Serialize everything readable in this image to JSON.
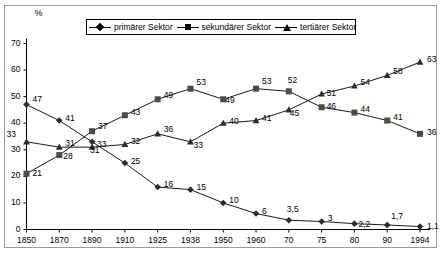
{
  "frame": {
    "border_color": "#9a9a9a"
  },
  "axis": {
    "y_unit": "%",
    "y_ticks": [
      "0",
      "10",
      "20",
      "30",
      "40",
      "50",
      "60",
      "70"
    ],
    "x_ticks": [
      "1850",
      "1870",
      "1890",
      "1910",
      "1925",
      "1938",
      "1950",
      "1960",
      "70",
      "75",
      "80",
      "90",
      "1994"
    ]
  },
  "legend": {
    "position": "top-center",
    "items": [
      {
        "label": "primärer Sektor",
        "marker": "diamond-marker",
        "color": "#000000"
      },
      {
        "label": "sekundärer Sektor",
        "marker": "square-marker",
        "color": "#000000"
      },
      {
        "label": "tertiärer Sektor",
        "marker": "triangle-marker",
        "color": "#000000"
      }
    ]
  },
  "chart_data": {
    "type": "line",
    "title": "",
    "xlabel": "",
    "ylabel": "%",
    "ylim": [
      0,
      70
    ],
    "ytick_step": 10,
    "grid": false,
    "legend_position": "top-center",
    "categories": [
      "1850",
      "1870",
      "1890",
      "1910",
      "1925",
      "1938",
      "1950",
      "1960",
      "70",
      "75",
      "80",
      "90",
      "1994"
    ],
    "series": [
      {
        "name": "primärer Sektor",
        "marker": "diamond",
        "values": [
          47,
          41,
          33,
          25,
          16,
          15,
          10,
          6,
          3.5,
          3,
          2.2,
          1.7,
          1.1
        ],
        "labels": [
          "47",
          "41",
          "33",
          "25",
          "16",
          "15",
          "10",
          "6",
          "3,5",
          "3",
          "2,2",
          "1,7",
          "1,1"
        ]
      },
      {
        "name": "sekundärer Sektor",
        "marker": "square",
        "values": [
          21,
          28,
          37,
          43,
          49,
          53,
          49,
          53,
          52,
          46,
          44,
          41,
          36
        ],
        "labels": [
          "21",
          "28",
          "37",
          "43",
          "49",
          "53",
          "49",
          "53",
          "52",
          "46",
          "44",
          "41",
          "36"
        ]
      },
      {
        "name": "tertiärer Sektor",
        "marker": "triangle",
        "values": [
          33,
          31,
          31,
          32,
          36,
          33,
          40,
          41,
          45,
          51,
          54,
          58,
          63
        ],
        "labels": [
          "33",
          "31",
          "31",
          "32",
          "36",
          "33",
          "40",
          "41",
          "45",
          "51",
          "54",
          "58",
          "63"
        ]
      }
    ]
  },
  "label_offsets": {
    "primärer Sektor": [
      [
        6,
        -6
      ],
      [
        6,
        -3
      ],
      [
        5,
        2
      ],
      [
        6,
        -2
      ],
      [
        6,
        -3
      ],
      [
        6,
        -3
      ],
      [
        6,
        -3
      ],
      [
        6,
        -3
      ],
      [
        -2,
        -11
      ],
      [
        6,
        -4
      ],
      [
        4,
        0
      ],
      [
        4,
        -9
      ],
      [
        7,
        -1
      ]
    ],
    "sekundärer Sektor": [
      [
        6,
        -1
      ],
      [
        4,
        1
      ],
      [
        6,
        -5
      ],
      [
        6,
        -3
      ],
      [
        6,
        -4
      ],
      [
        6,
        -7
      ],
      [
        2,
        1
      ],
      [
        6,
        -8
      ],
      [
        -1,
        -11
      ],
      [
        5,
        -1
      ],
      [
        6,
        -4
      ],
      [
        6,
        -4
      ],
      [
        7,
        -2
      ]
    ],
    "tertiärer Sektor": [
      [
        -20,
        -8
      ],
      [
        6,
        -4
      ],
      [
        -2,
        3
      ],
      [
        6,
        -3
      ],
      [
        6,
        -5
      ],
      [
        3,
        3
      ],
      [
        6,
        -2
      ],
      [
        6,
        -3
      ],
      [
        1,
        3
      ],
      [
        5,
        -1
      ],
      [
        6,
        -4
      ],
      [
        6,
        -4
      ],
      [
        7,
        -3
      ]
    ]
  }
}
